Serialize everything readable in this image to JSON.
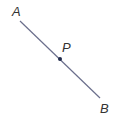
{
  "diagram": {
    "segment": {
      "start": {
        "label": "A",
        "x": 20,
        "y": 21
      },
      "end": {
        "label": "B",
        "x": 100,
        "y": 98
      },
      "color": "#6b6f8c"
    },
    "point": {
      "label": "P",
      "x": 60,
      "y": 59,
      "color": "#1f2a4a"
    },
    "labels": [
      {
        "text": "A",
        "x": 12,
        "y": 16
      },
      {
        "text": "P",
        "x": 62,
        "y": 52
      },
      {
        "text": "B",
        "x": 100,
        "y": 113
      }
    ]
  }
}
